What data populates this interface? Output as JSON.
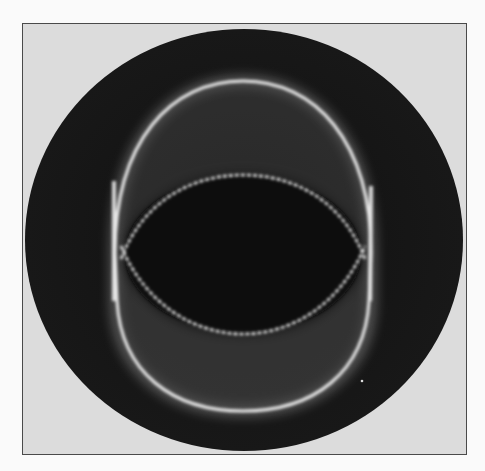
{
  "figure": {
    "caption": "",
    "colors": {
      "background": "#fafafa",
      "frame_fill": "#dcdcdc",
      "frame_border": "#4a4a4a",
      "disc": "#141414",
      "glow": "#f0f0f0"
    }
  }
}
